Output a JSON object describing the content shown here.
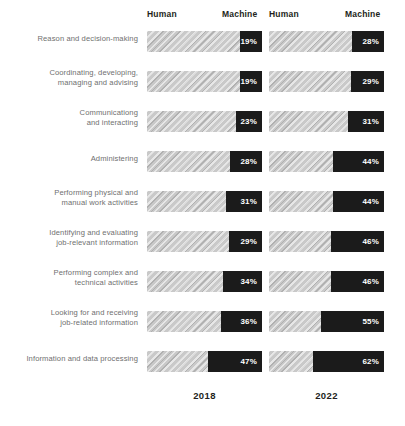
{
  "chart_data": {
    "type": "bar",
    "title": "",
    "subtitle": "",
    "xlabel": "",
    "ylabel": "",
    "xlim": [
      0,
      100
    ],
    "grid": false,
    "legend_position": "top",
    "orientation": "horizontal",
    "stacked": true,
    "note": "Share of task hours performed by Human vs Machine, by work activity, 2018 vs 2022. Each bar totals 100%; the dark segment is the Machine share shown as a labelled percentage.",
    "segment_labels": [
      "Human",
      "Machine"
    ],
    "groups": [
      "2018",
      "2022"
    ],
    "categories": [
      "Reason and decision-making",
      "Coordinating, developing, managing and advising",
      "Communicationg and interacting",
      "Administering",
      "Performing physical and manual work activities",
      "Identifying and evaluating job-relevant information",
      "Performing complex and technical activities",
      "Looking for and receiving job-related information",
      "Information and data processing"
    ],
    "series": [
      {
        "name": "2018",
        "machine_values": [
          19,
          19,
          23,
          28,
          31,
          29,
          34,
          36,
          47
        ],
        "human_values": [
          81,
          81,
          77,
          72,
          69,
          71,
          66,
          64,
          53
        ],
        "labels": [
          "19%",
          "19%",
          "23%",
          "28%",
          "31%",
          "29%",
          "34%",
          "36%",
          "47%"
        ]
      },
      {
        "name": "2022",
        "machine_values": [
          28,
          29,
          31,
          44,
          44,
          46,
          46,
          55,
          62
        ],
        "human_values": [
          72,
          71,
          69,
          56,
          56,
          54,
          54,
          45,
          38
        ],
        "labels": [
          "28%",
          "29%",
          "31%",
          "44%",
          "44%",
          "46%",
          "46%",
          "55%",
          "62%"
        ]
      }
    ],
    "colors": {
      "human_segment": "#c9c9c9",
      "machine_segment": "#1b1b1b",
      "label_text": "#6f6f6f",
      "header_text": "#231f20",
      "value_text": "#ffffff",
      "background": "#ffffff"
    }
  },
  "headers": {
    "group1": {
      "human": "Human",
      "machine": "Machine"
    },
    "group2": {
      "human": "Human",
      "machine": "Machine"
    }
  },
  "footer": {
    "year1": "2018",
    "year2": "2022"
  },
  "rows": [
    {
      "label_line1": "Reason and decision-making",
      "label_line2": "",
      "v2018": "19%",
      "v2022": "28%"
    },
    {
      "label_line1": "Coordinating, developing,",
      "label_line2": "managing and advising",
      "v2018": "19%",
      "v2022": "29%"
    },
    {
      "label_line1": "Communicationg",
      "label_line2": "and interacting",
      "v2018": "23%",
      "v2022": "31%"
    },
    {
      "label_line1": "Administering",
      "label_line2": "",
      "v2018": "28%",
      "v2022": "44%"
    },
    {
      "label_line1": "Performing physical and",
      "label_line2": "manual work activities",
      "v2018": "31%",
      "v2022": "44%"
    },
    {
      "label_line1": "Identifying and evaluating",
      "label_line2": "job-relevant information",
      "v2018": "29%",
      "v2022": "46%"
    },
    {
      "label_line1": "Performing complex and",
      "label_line2": "technical activities",
      "v2018": "34%",
      "v2022": "46%"
    },
    {
      "label_line1": "Looking for and receiving",
      "label_line2": "job-related information",
      "v2018": "36%",
      "v2022": "55%"
    },
    {
      "label_line1": "Information and data processing",
      "label_line2": "",
      "v2018": "47%",
      "v2022": "62%"
    }
  ]
}
